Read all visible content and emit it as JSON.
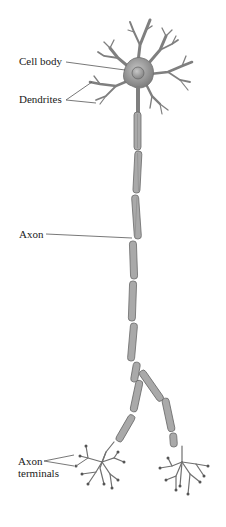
{
  "diagram": {
    "labels": {
      "cell_body": "Cell body",
      "dendrites": "Dendrites",
      "axon": "Axon",
      "axon_terminals_line1": "Axon",
      "axon_terminals_line2": "terminals"
    },
    "colors": {
      "background": "#ffffff",
      "neuron_fill": "#8c8c8c",
      "neuron_stroke": "#5a5a5a",
      "nucleus": "#9e9e9e",
      "myelin_fill": "#a8a8a8",
      "leader_line": "#555555",
      "text": "#1a1a1a"
    }
  }
}
